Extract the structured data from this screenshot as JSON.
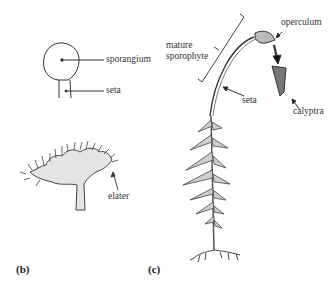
{
  "figure": {
    "panel_b": {
      "label": "(b)",
      "labels": {
        "sporangium": "sporangium",
        "seta": "seta",
        "elater": "elater"
      }
    },
    "panel_c": {
      "label": "(c)",
      "labels": {
        "mature_sporophyte_line1": "mature",
        "mature_sporophyte_line2": "sporophyte",
        "seta": "seta",
        "operculum": "operculum",
        "calyptra": "calyptra"
      }
    }
  }
}
